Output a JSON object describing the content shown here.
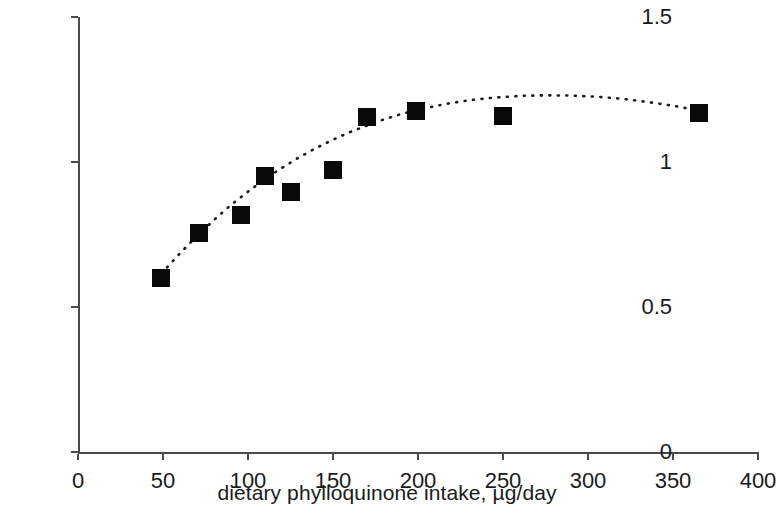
{
  "chart_data": {
    "type": "scatter",
    "title": "",
    "xlabel": "dietary phylloquinone intake, µg/day",
    "ylabel": "plasma phylloquinone, nM",
    "xlim": [
      0,
      400
    ],
    "ylim": [
      0,
      1.5
    ],
    "xticks": [
      0,
      50,
      100,
      150,
      200,
      250,
      300,
      350,
      400
    ],
    "xtick_labels": [
      "0",
      "50",
      "100",
      "150",
      "200",
      "250",
      "300",
      "350",
      "400"
    ],
    "yticks": [
      0,
      0.5,
      1,
      1.5
    ],
    "ytick_labels": [
      "0",
      "0.5",
      "1",
      "1.5"
    ],
    "grid": false,
    "legend": null,
    "marker": {
      "shape": "square",
      "color": "#090909",
      "size_px": 18
    },
    "series": [
      {
        "name": "observed means",
        "marker_style": "filled-square",
        "points": [
          {
            "x": 49,
            "y": 0.6
          },
          {
            "x": 71,
            "y": 0.755
          },
          {
            "x": 96,
            "y": 0.818
          },
          {
            "x": 110,
            "y": 0.952
          },
          {
            "x": 125,
            "y": 0.897
          },
          {
            "x": 150,
            "y": 0.972
          },
          {
            "x": 170,
            "y": 1.155
          },
          {
            "x": 199,
            "y": 1.175
          },
          {
            "x": 250,
            "y": 1.16
          },
          {
            "x": 365,
            "y": 1.168
          }
        ]
      }
    ],
    "trend": {
      "name": "fitted curve",
      "style": "dotted",
      "color": "#1a1a1a",
      "points": [
        {
          "x": 49,
          "y": 0.615
        },
        {
          "x": 60,
          "y": 0.685
        },
        {
          "x": 70,
          "y": 0.745
        },
        {
          "x": 80,
          "y": 0.8
        },
        {
          "x": 90,
          "y": 0.852
        },
        {
          "x": 100,
          "y": 0.898
        },
        {
          "x": 110,
          "y": 0.941
        },
        {
          "x": 120,
          "y": 0.98
        },
        {
          "x": 130,
          "y": 1.016
        },
        {
          "x": 140,
          "y": 1.048
        },
        {
          "x": 150,
          "y": 1.077
        },
        {
          "x": 160,
          "y": 1.103
        },
        {
          "x": 170,
          "y": 1.126
        },
        {
          "x": 180,
          "y": 1.147
        },
        {
          "x": 190,
          "y": 1.165
        },
        {
          "x": 200,
          "y": 1.18
        },
        {
          "x": 215,
          "y": 1.199
        },
        {
          "x": 230,
          "y": 1.213
        },
        {
          "x": 245,
          "y": 1.222
        },
        {
          "x": 260,
          "y": 1.228
        },
        {
          "x": 275,
          "y": 1.23
        },
        {
          "x": 290,
          "y": 1.229
        },
        {
          "x": 305,
          "y": 1.225
        },
        {
          "x": 320,
          "y": 1.218
        },
        {
          "x": 335,
          "y": 1.207
        },
        {
          "x": 350,
          "y": 1.194
        },
        {
          "x": 360,
          "y": 1.183
        },
        {
          "x": 370,
          "y": 1.172
        }
      ]
    }
  }
}
